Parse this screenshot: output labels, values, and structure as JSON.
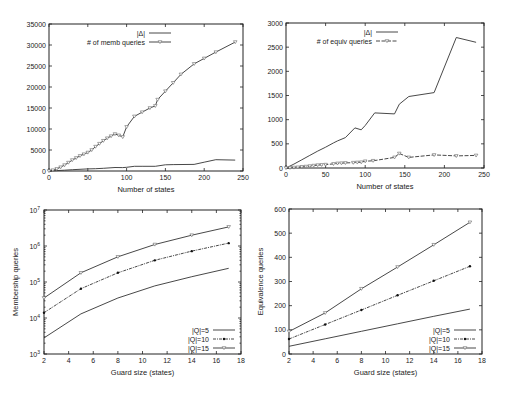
{
  "chart_data": [
    {
      "id": "memb",
      "type": "line",
      "title": "",
      "xlabel": "Number of states",
      "ylabel": "",
      "xlim": [
        0,
        250
      ],
      "ylim": [
        0,
        35000
      ],
      "xticks": [
        0,
        50,
        100,
        150,
        200,
        250
      ],
      "yticks": [
        0,
        5000,
        10000,
        15000,
        20000,
        25000,
        30000,
        35000
      ],
      "grid": false,
      "legend_position": "top-left inside",
      "plot_box": {
        "x0": 49,
        "y0": 24,
        "x1": 243,
        "y1": 171
      },
      "series": [
        {
          "name": "|Δ|",
          "style": "solid",
          "marker": "none",
          "x": [
            0,
            10,
            20,
            30,
            40,
            50,
            60,
            70,
            85,
            95,
            100,
            110,
            120,
            137,
            150,
            160,
            187,
            200,
            215,
            240
          ],
          "values": [
            0,
            100,
            200,
            300,
            400,
            500,
            550,
            650,
            830,
            800,
            870,
            1130,
            1130,
            1110,
            1480,
            1520,
            1560,
            2100,
            2700,
            2600
          ]
        },
        {
          "name": "# of memb queries",
          "style": "solid",
          "marker": "triangle-down",
          "x": [
            0,
            5,
            10,
            15,
            20,
            25,
            30,
            35,
            40,
            45,
            50,
            55,
            60,
            65,
            70,
            75,
            80,
            85,
            90,
            95,
            100,
            110,
            120,
            130,
            137,
            140,
            150,
            160,
            170,
            187,
            200,
            215,
            240
          ],
          "values": [
            0,
            200,
            500,
            900,
            1400,
            2000,
            2600,
            3100,
            3600,
            4000,
            4400,
            5000,
            5800,
            6500,
            7200,
            7800,
            8300,
            8800,
            8500,
            8100,
            10500,
            13000,
            14000,
            15000,
            15500,
            17000,
            19000,
            21000,
            23000,
            25500,
            26800,
            28300,
            30700
          ]
        }
      ]
    },
    {
      "id": "equiv",
      "type": "line",
      "title": "",
      "xlabel": "Number of states",
      "ylabel": "",
      "xlim": [
        0,
        250
      ],
      "ylim": [
        0,
        3000
      ],
      "xticks": [
        0,
        50,
        100,
        150,
        200,
        250
      ],
      "yticks": [
        0,
        500,
        1000,
        1500,
        2000,
        2500,
        3000
      ],
      "grid": false,
      "legend_position": "top-left inside",
      "plot_box": {
        "x0": 286,
        "y0": 23,
        "x1": 484,
        "y1": 168
      },
      "series": [
        {
          "name": "|Δ|",
          "style": "solid",
          "marker": "none",
          "x": [
            0,
            10,
            20,
            30,
            40,
            50,
            60,
            65,
            75,
            87,
            95,
            100,
            112,
            137,
            143,
            155,
            187,
            215,
            240
          ],
          "values": [
            0,
            80,
            170,
            260,
            350,
            430,
            520,
            560,
            630,
            830,
            790,
            880,
            1140,
            1120,
            1320,
            1480,
            1560,
            2700,
            2600
          ]
        },
        {
          "name": "# of equiv queries",
          "style": "dashed",
          "marker": "triangle-down",
          "x": [
            0,
            5,
            10,
            15,
            20,
            25,
            30,
            35,
            40,
            45,
            50,
            60,
            65,
            70,
            75,
            85,
            90,
            95,
            100,
            110,
            137,
            143,
            155,
            187,
            215,
            240
          ],
          "values": [
            0,
            5,
            10,
            15,
            25,
            30,
            40,
            50,
            60,
            65,
            70,
            85,
            95,
            100,
            105,
            110,
            115,
            120,
            140,
            150,
            220,
            300,
            220,
            270,
            250,
            260
          ]
        }
      ]
    },
    {
      "id": "memb_guard",
      "type": "line",
      "title": "",
      "xlabel": "Guard size (states)",
      "ylabel": "Membership queries",
      "yscale": "log",
      "xlim": [
        2,
        18
      ],
      "ylim": [
        1000,
        10000000
      ],
      "xticks": [
        2,
        4,
        6,
        8,
        10,
        12,
        14,
        16,
        18
      ],
      "yticks": [
        "10^3",
        "10^4",
        "10^5",
        "10^6",
        "10^7"
      ],
      "grid": false,
      "legend_position": "bottom-right inside",
      "plot_box": {
        "x0": 44,
        "y0": 210,
        "x1": 241,
        "y1": 354
      },
      "series": [
        {
          "name": "|Q|=5",
          "style": "solid",
          "marker": "none",
          "x": [
            2,
            5,
            8,
            11,
            14,
            17
          ],
          "values": [
            2800,
            13000,
            36000,
            78000,
            140000,
            240000
          ]
        },
        {
          "name": "|Q|=10",
          "style": "dash-dot",
          "marker": "dot",
          "x": [
            2,
            5,
            8,
            11,
            14,
            17
          ],
          "values": [
            14000,
            65000,
            180000,
            400000,
            720000,
            1200000
          ]
        },
        {
          "name": "|Q|=15",
          "style": "solid",
          "marker": "triangle-down",
          "x": [
            2,
            5,
            8,
            11,
            14,
            17
          ],
          "values": [
            36000,
            180000,
            500000,
            1100000,
            2000000,
            3400000
          ]
        }
      ]
    },
    {
      "id": "equiv_guard",
      "type": "line",
      "title": "",
      "xlabel": "Guard size (states)",
      "ylabel": "Equivalence queries",
      "xlim": [
        2,
        18
      ],
      "ylim": [
        0,
        600
      ],
      "xticks": [
        2,
        4,
        6,
        8,
        10,
        12,
        14,
        16,
        18
      ],
      "yticks": [
        0,
        100,
        200,
        300,
        400,
        500,
        600
      ],
      "grid": false,
      "legend_position": "bottom-right inside",
      "plot_box": {
        "x0": 289,
        "y0": 209,
        "x1": 482,
        "y1": 354
      },
      "series": [
        {
          "name": "|Q|=5",
          "style": "solid",
          "marker": "none",
          "x": [
            2,
            5,
            8,
            11,
            14,
            17
          ],
          "values": [
            32,
            63,
            94,
            125,
            156,
            186
          ]
        },
        {
          "name": "|Q|=10",
          "style": "dash-dot",
          "marker": "dot",
          "x": [
            2,
            5,
            8,
            11,
            14,
            17
          ],
          "values": [
            62,
            122,
            182,
            243,
            303,
            363
          ]
        },
        {
          "name": "|Q|=15",
          "style": "solid",
          "marker": "triangle-down",
          "x": [
            2,
            5,
            8,
            11,
            14,
            17
          ],
          "values": [
            93,
            170,
            270,
            360,
            452,
            545
          ]
        }
      ]
    }
  ]
}
